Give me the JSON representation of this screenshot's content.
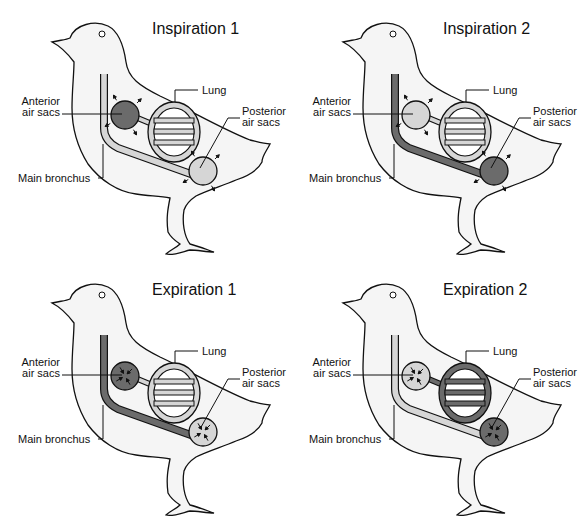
{
  "colors": {
    "dark": "#6b6b6b",
    "light": "#d6d6d6",
    "body": "#f5f5f5",
    "line": "#111111"
  },
  "labels": {
    "anterior_1": "Anterior",
    "anterior_2": "air sacs",
    "posterior_1": "Posterior",
    "posterior_2": "air sacs",
    "lung": "Lung",
    "bronchus": "Main bronchus"
  },
  "panels": [
    {
      "title": "Inspiration 1",
      "bronchus": "light",
      "anterior": "dark",
      "posterior": "light",
      "lung": "light",
      "arrows": "out"
    },
    {
      "title": "Inspiration 2",
      "bronchus": "dark",
      "anterior": "light",
      "posterior": "dark",
      "lung": "light",
      "arrows": "out"
    },
    {
      "title": "Expiration 1",
      "bronchus": "dark",
      "anterior": "dark",
      "posterior": "light",
      "lung": "light",
      "arrows": "in"
    },
    {
      "title": "Expiration 2",
      "bronchus": "light",
      "anterior": "light",
      "posterior": "dark",
      "lung": "dark",
      "arrows": "in"
    }
  ]
}
